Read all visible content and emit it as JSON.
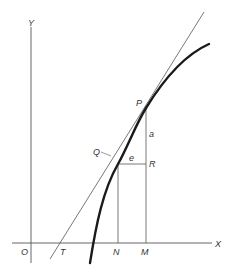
{
  "diagram": {
    "title": "",
    "axes": {
      "y_label": "Y",
      "x_label": "X",
      "origin_label": "O"
    },
    "points": {
      "P": "P",
      "Q": "Q",
      "R": "R",
      "T": "T",
      "N": "N",
      "M": "M"
    },
    "segment_labels": {
      "a": "a",
      "e": "e"
    },
    "colors": {
      "line": "#555555",
      "curve": "#1a1a1a",
      "text": "#333333",
      "background": "#ffffff"
    }
  }
}
